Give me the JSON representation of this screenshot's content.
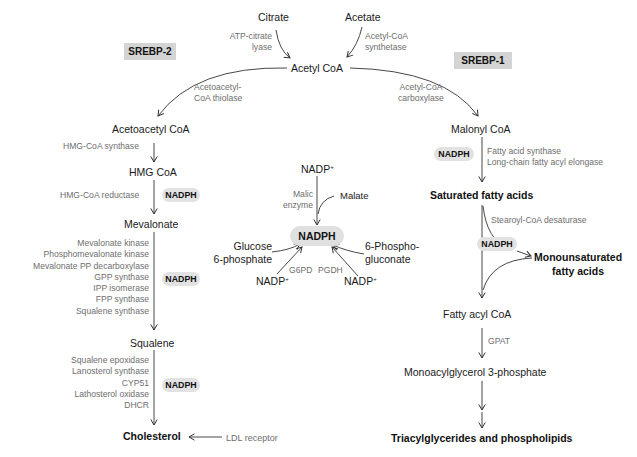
{
  "regulators": {
    "left": "SREBP-2",
    "right": "SREBP-1"
  },
  "top": {
    "citrate": "Citrate",
    "acetate": "Acetate",
    "atp_citrate_lyase_1": "ATP-citrate",
    "atp_citrate_lyase_2": "lyase",
    "acetyl_coa_synthetase_1": "Acetyl-CoA",
    "acetyl_coa_synthetase_2": "synthetase",
    "acetyl_coa": "Acetyl CoA"
  },
  "cholesterol_pathway": {
    "thiolase_1": "Acetoacetyl-",
    "thiolase_2": "CoA thiolase",
    "acetoacetyl_coa": "Acetoacetyl CoA",
    "hmg_coa_synthase": "HMG-CoA synthase",
    "hmg_coa": "HMG CoA",
    "hmg_coa_reductase": "HMG-CoA reductase",
    "nadph_1": "NADPH",
    "mevalonate": "Mevalonate",
    "mevalonate_enzymes": [
      "Mevalonate kinase",
      "Phosphomevalonate kinase",
      "Mevalonate PP decarboxylase",
      "GPP synthase",
      "IPP isomerase",
      "FPP synthase",
      "Squalene synthase"
    ],
    "nadph_2": "NADPH",
    "squalene": "Squalene",
    "squalene_enzymes": [
      "Squalene epoxidase",
      "Lanosterol synthase",
      "CYP51",
      "Lathosterol oxidase",
      "DHCR"
    ],
    "nadph_3": "NADPH",
    "cholesterol": "Cholesterol",
    "ldl_receptor": "LDL receptor"
  },
  "nadph_center": {
    "nadp_top": "NADP",
    "plus": "+",
    "malic_enzyme_1": "Malic",
    "malic_enzyme_2": "enzyme",
    "malate": "Malate",
    "nadph": "NADPH",
    "glucose_1": "Glucose",
    "glucose_2": "6-phosphate",
    "g6pd": "G6PD",
    "pgdh": "PGDH",
    "phosphogluconate_1": "6-Phospho-",
    "phosphogluconate_2": "gluconate",
    "nadp_left": "NADP",
    "nadp_right": "NADP"
  },
  "fatty_acid_pathway": {
    "acc_1": "Acetyl-CoA",
    "acc_2": "carboxylase",
    "malonyl_coa": "Malonyl CoA",
    "nadph_1": "NADPH",
    "fas": "Fatty acid synthase",
    "elongase": "Long-chain fatty acyl elongase",
    "saturated": "Saturated fatty acids",
    "scd": "Stearoyl-CoA desaturase",
    "nadph_2": "NADPH",
    "mufa_1": "Monounsaturated",
    "mufa_2": "fatty acids",
    "fatty_acyl_coa": "Fatty acyl CoA",
    "gpat": "GPAT",
    "mag3p": "Monoacylglycerol 3-phosphate",
    "tag": "Triacylglycerides and phospholipids"
  },
  "colors": {
    "text": "#1a1a1a",
    "enzyme_text": "#6e6e6e",
    "srebp_box": "#d4d4d4",
    "nadph_pill": "#e2e2e2",
    "arrow": "#333333"
  }
}
